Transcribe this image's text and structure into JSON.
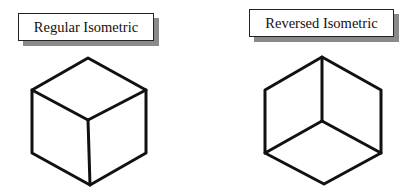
{
  "diagrams": [
    {
      "label": "Regular Isometric",
      "cube": {
        "outline": "88,58 146,90 146,153 90,185 32,153 32,90",
        "inner_edges": [
          [
            32,
            90,
            88,
            120
          ],
          [
            146,
            90,
            88,
            120
          ],
          [
            88,
            120,
            90,
            185
          ]
        ]
      }
    },
    {
      "label": "Reversed Isometric",
      "cube": {
        "outline": "322,57 381,90 381,153 324,184 265,153 265,90",
        "inner_edges": [
          [
            322,
            57,
            322,
            121
          ],
          [
            265,
            153,
            322,
            121
          ],
          [
            381,
            153,
            322,
            121
          ]
        ]
      }
    }
  ],
  "colors": {
    "stroke": "#111111",
    "shadow": "#8a8a8a",
    "background": "#ffffff"
  }
}
